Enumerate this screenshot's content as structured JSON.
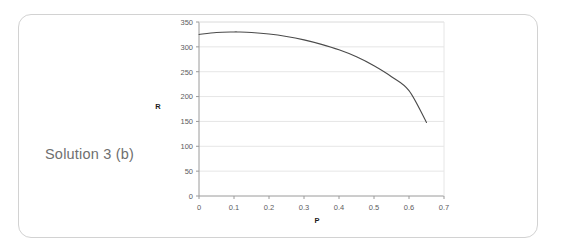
{
  "figure": {
    "caption": "Solution 3 (b)",
    "frame_color": "#d2d2d2",
    "background_color": "#ffffff",
    "caption_color": "#6f6f6f"
  },
  "chart_data": {
    "type": "line",
    "title": "",
    "xlabel": "P",
    "ylabel": "R",
    "xlim": [
      0,
      0.7
    ],
    "ylim": [
      0,
      350
    ],
    "xticks": [
      "0",
      "0.1",
      "0.2",
      "0.3",
      "0.4",
      "0.5",
      "0.6",
      "0.7"
    ],
    "xtick_values": [
      0,
      0.1,
      0.2,
      0.3,
      0.4,
      0.5,
      0.6,
      0.7
    ],
    "yticks": [
      "0",
      "50",
      "100",
      "150",
      "200",
      "250",
      "300",
      "350"
    ],
    "ytick_values": [
      0,
      50,
      100,
      150,
      200,
      250,
      300,
      350
    ],
    "grid": "horizontal",
    "grid_color": "#e6e6e6",
    "axis_color": "#9a9a9a",
    "legend": null,
    "series": [
      {
        "name": "R(P)",
        "color": "#4a4a4a",
        "x": [
          0.0,
          0.05,
          0.1,
          0.11,
          0.15,
          0.2,
          0.25,
          0.3,
          0.35,
          0.4,
          0.45,
          0.5,
          0.55,
          0.6,
          0.65
        ],
        "y": [
          325,
          329,
          330,
          330,
          329,
          326,
          321,
          314,
          305,
          294,
          280,
          262,
          240,
          212,
          148
        ]
      }
    ]
  }
}
